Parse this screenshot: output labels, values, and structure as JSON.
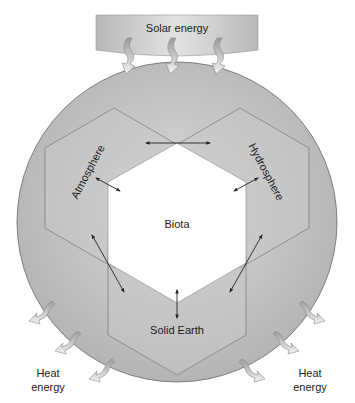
{
  "diagram": {
    "nodes": {
      "solar": "Solar energy",
      "atmosphere": "Atmosphere",
      "hydrosphere": "Hydrosphere",
      "biota": "Biota",
      "solid_earth": "Solid Earth",
      "heat_left_1": "Heat",
      "heat_left_2": "energy",
      "heat_right_1": "Heat",
      "heat_right_2": "energy"
    },
    "edges": [
      {
        "from": "Atmosphere",
        "to": "Hydrosphere",
        "type": "two-way"
      },
      {
        "from": "Atmosphere",
        "to": "Biota",
        "type": "two-way"
      },
      {
        "from": "Hydrosphere",
        "to": "Biota",
        "type": "two-way"
      },
      {
        "from": "Solid Earth",
        "to": "Biota",
        "type": "two-way"
      },
      {
        "from": "Atmosphere",
        "to": "Solid Earth",
        "type": "two-way"
      },
      {
        "from": "Hydrosphere",
        "to": "Solid Earth",
        "type": "two-way"
      },
      {
        "from": "Solar energy",
        "to": "Earth system",
        "type": "input",
        "count": 3
      },
      {
        "from": "Earth system",
        "to": "Heat energy",
        "type": "output",
        "count": 6
      }
    ],
    "colors": {
      "sphere": "#bdbdbd",
      "hex": "#c9c9c9",
      "biota": "#ffffff",
      "outline": "#666666"
    }
  }
}
